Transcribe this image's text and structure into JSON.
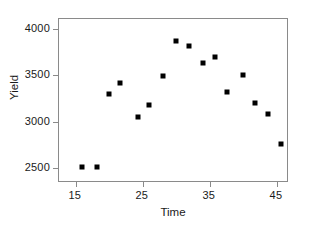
{
  "chart_data": {
    "type": "scatter",
    "title": "",
    "xlabel": "Time",
    "ylabel": "Yield",
    "xlim": [
      12.5,
      46.5
    ],
    "ylim": [
      2360,
      4110
    ],
    "xticks": [
      15,
      25,
      35,
      45
    ],
    "yticks": [
      2500,
      3000,
      3500,
      4000
    ],
    "xtick_labels": [
      "15",
      "25",
      "35",
      "45"
    ],
    "ytick_labels": [
      "2500",
      "3000",
      "3500",
      "4000"
    ],
    "grid": false,
    "legend": null,
    "marker": "filled-square",
    "marker_color": "#000000",
    "series": [
      {
        "name": "Yield vs Time",
        "points": [
          {
            "x": 16.0,
            "y": 2510
          },
          {
            "x": 18.2,
            "y": 2515
          },
          {
            "x": 20.0,
            "y": 3300
          },
          {
            "x": 21.6,
            "y": 3415
          },
          {
            "x": 24.3,
            "y": 3050
          },
          {
            "x": 25.9,
            "y": 3185
          },
          {
            "x": 28.0,
            "y": 3490
          },
          {
            "x": 30.0,
            "y": 3875
          },
          {
            "x": 31.9,
            "y": 3815
          },
          {
            "x": 33.9,
            "y": 3635
          },
          {
            "x": 35.7,
            "y": 3695
          },
          {
            "x": 37.6,
            "y": 3325
          },
          {
            "x": 40.0,
            "y": 3500
          },
          {
            "x": 41.7,
            "y": 3200
          },
          {
            "x": 43.6,
            "y": 3085
          },
          {
            "x": 45.6,
            "y": 2760
          }
        ]
      }
    ]
  }
}
